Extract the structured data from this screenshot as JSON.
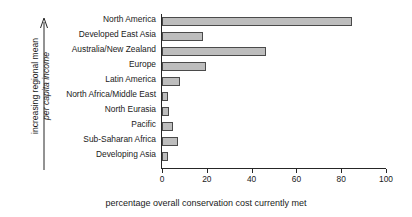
{
  "chart_data": {
    "type": "bar",
    "orientation": "horizontal",
    "title": "",
    "xlabel": "percentage overall conservation cost currently met",
    "ylabel_line1": "increasing regional mean",
    "ylabel_line2": "per capita income",
    "ylabel_arrow": "up-arrow",
    "xlim": [
      0,
      100
    ],
    "xticks": [
      0,
      20,
      40,
      60,
      80,
      100
    ],
    "xtick_labels": [
      "0",
      "20",
      "40",
      "60",
      "80",
      "100"
    ],
    "grid": false,
    "legend": null,
    "categories": [
      "North America",
      "Developed East Asia",
      "Australia/New Zealand",
      "Europe",
      "Latin America",
      "North Africa/Middle East",
      "North Eurasia",
      "Pacific",
      "Sub-Saharan Africa",
      "Developing Asia"
    ],
    "values": [
      85,
      18.3,
      46.5,
      19.6,
      8,
      2.5,
      3.2,
      5,
      7,
      2.5
    ],
    "bar_fill_color": "#bdbdbd",
    "bar_edge_color": "#4a4a4a",
    "axis_color": "#262626"
  }
}
